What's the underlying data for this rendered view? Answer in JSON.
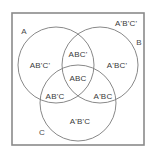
{
  "figure": {
    "colors": {
      "frame": "#8a8a8a",
      "circle": "#7a7a7a",
      "text": "#3a3a3a",
      "background": "#ffffff"
    },
    "universe": {
      "frame_label": "A'B'C'",
      "frame_label_x": 126,
      "frame_label_y": 24
    },
    "set_names": [
      {
        "label": "A",
        "x": 24,
        "y": 32
      },
      {
        "label": "B",
        "x": 139,
        "y": 43
      },
      {
        "label": "C",
        "x": 42,
        "y": 133
      }
    ],
    "circles": [
      {
        "name": "A",
        "cx": 56,
        "cy": 65,
        "r": 38
      },
      {
        "name": "B",
        "cx": 100,
        "cy": 65,
        "r": 38
      },
      {
        "name": "C",
        "cx": 78,
        "cy": 103,
        "r": 38
      }
    ],
    "regions": [
      {
        "name": "A-only",
        "label": "AB'C'",
        "x": 40,
        "y": 66
      },
      {
        "name": "AB-only",
        "label": "ABC'",
        "x": 78,
        "y": 55
      },
      {
        "name": "B-only",
        "label": "A'BC'",
        "x": 117,
        "y": 66
      },
      {
        "name": "AC-only",
        "label": "AB'C",
        "x": 55,
        "y": 97
      },
      {
        "name": "ABC",
        "label": "ABC",
        "x": 78,
        "y": 79
      },
      {
        "name": "BC-only",
        "label": "A'BC",
        "x": 103,
        "y": 97
      },
      {
        "name": "C-only",
        "label": "A'B'C",
        "x": 80,
        "y": 122
      }
    ]
  }
}
